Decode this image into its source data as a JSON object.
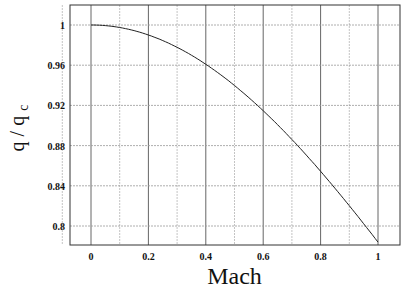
{
  "chart_data": {
    "type": "line",
    "title": "",
    "xlabel": "Mach",
    "ylabel": "q / q",
    "ylabel_subscript": "c",
    "xlim": [
      -0.245,
      1.08
    ],
    "ylim": [
      0.7755,
      1.0195
    ],
    "grid": true,
    "xticks": [
      0,
      0.2,
      0.4,
      0.6,
      0.8,
      1
    ],
    "xtick_labels": [
      "0",
      "0.2",
      "0.4",
      "0.6",
      "0.8",
      "1"
    ],
    "xgrid": [
      -0.1,
      0,
      0.1,
      0.2,
      0.3,
      0.4,
      0.5,
      0.6,
      0.7,
      0.8,
      0.9,
      1.0
    ],
    "yticks": [
      0.8,
      0.84,
      0.88,
      0.92,
      0.96,
      1
    ],
    "ytick_labels": [
      "0.8",
      "0.84",
      "0.88",
      "0.92",
      "0.96",
      "1"
    ],
    "series": [
      {
        "name": "q/qc",
        "x": [
          0,
          0.1,
          0.2,
          0.3,
          0.4,
          0.5,
          0.6,
          0.7,
          0.8,
          0.9,
          1.0
        ],
        "y": [
          1.0,
          0.9975,
          0.99,
          0.9778,
          0.9611,
          0.9403,
          0.9157,
          0.8878,
          0.8571,
          0.8242,
          0.7837
        ]
      }
    ]
  }
}
